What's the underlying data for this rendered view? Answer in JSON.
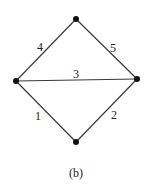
{
  "figure": {
    "caption": "(b)",
    "caption_pos": {
      "x": 76,
      "y": 177
    },
    "colors": {
      "edge": "#3a3a3a",
      "node": "#111111",
      "text": "#222222",
      "background": "#ffffff"
    }
  },
  "graph": {
    "nodes": [
      {
        "id": "top",
        "x": 76,
        "y": 19
      },
      {
        "id": "left",
        "x": 16,
        "y": 81
      },
      {
        "id": "right",
        "x": 137,
        "y": 79
      },
      {
        "id": "bottom",
        "x": 76,
        "y": 142
      }
    ],
    "edges": [
      {
        "label": "1",
        "from": "left",
        "to": "bottom",
        "label_x": 38,
        "label_y": 120
      },
      {
        "label": "2",
        "from": "bottom",
        "to": "right",
        "label_x": 114,
        "label_y": 119
      },
      {
        "label": "3",
        "from": "left",
        "to": "right",
        "label_x": 76,
        "label_y": 78
      },
      {
        "label": "4",
        "from": "left",
        "to": "top",
        "label_x": 40,
        "label_y": 51
      },
      {
        "label": "5",
        "from": "top",
        "to": "right",
        "label_x": 113,
        "label_y": 52
      }
    ]
  }
}
